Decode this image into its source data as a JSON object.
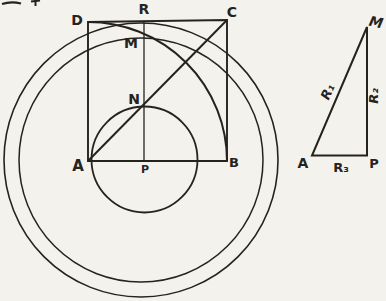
{
  "colors": {
    "paper": "#f4f2ec",
    "ink": "#26231f",
    "halftone_dot": "#55514a"
  },
  "main_figure": {
    "vertex_labels": {
      "D": "D",
      "R": "R",
      "C": "C",
      "M": "M",
      "N": "N",
      "A": "A",
      "P": "P",
      "B": "B"
    }
  },
  "triangle_figure": {
    "vertex_labels": {
      "M": "M",
      "A": "A",
      "P": "P"
    },
    "side_labels": {
      "R1": "R₁",
      "R2": "R₂",
      "R3": "R₃"
    }
  }
}
